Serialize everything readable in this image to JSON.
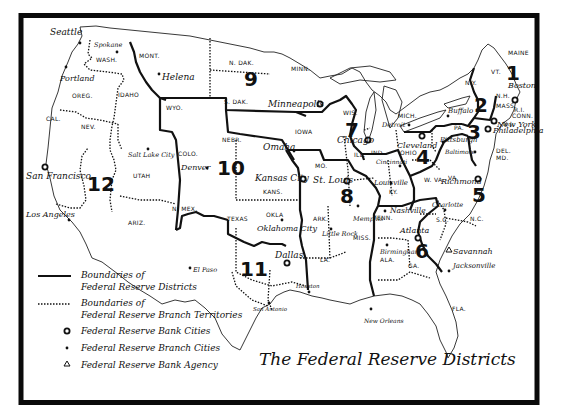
{
  "title": "The Federal Reserve Districts",
  "legend": [
    {
      "symbol": "solid-line",
      "label_line1": "Boundaries of",
      "label_line2": "Federal Reserve Districts"
    },
    {
      "symbol": "dotted-line",
      "label_line1": "Boundaries of",
      "label_line2": "Federal Reserve Branch Territories"
    },
    {
      "symbol": "open-circle",
      "label_line1": "Federal Reserve Bank Cities"
    },
    {
      "symbol": "dot",
      "label_line1": "Federal Reserve Branch Cities"
    },
    {
      "symbol": "triangle",
      "label_line1": "Federal Reserve Bank Agency"
    }
  ],
  "districts": [
    "1",
    "2",
    "3",
    "4",
    "5",
    "6",
    "7",
    "8",
    "9",
    "10",
    "11",
    "12"
  ],
  "states": [
    "WASH.",
    "OREG.",
    "CAL.",
    "NEV.",
    "IDAHO",
    "MONT.",
    "WYO.",
    "UTAH",
    "ARIZ.",
    "COLO.",
    "N. MEX.",
    "N. DAK.",
    "S. DAK.",
    "NEBR.",
    "KANS.",
    "OKLA",
    "TEXAS",
    "MINN.",
    "IOWA",
    "MO.",
    "ARK.",
    "LA.",
    "WIS.",
    "ILL.",
    "MISS.",
    "IND.",
    "OHIO",
    "KY.",
    "TENN.",
    "ALA.",
    "MICH.",
    "GA.",
    "FLA.",
    "S.C.",
    "N.C.",
    "VA.",
    "W. VA.",
    "PA.",
    "N.Y.",
    "VT.",
    "N.H.",
    "MAINE",
    "MASS.",
    "R.I.",
    "CONN.",
    "N.J.",
    "DEL.",
    "MD."
  ],
  "bank_cities": [
    "Boston",
    "New York",
    "Philadelphia",
    "Cleveland",
    "Richmond",
    "Atlanta",
    "Chicago",
    "St. Louis",
    "Minneapolis",
    "Kansas City",
    "Dallas",
    "San Francisco"
  ],
  "branch_cities": [
    "Seattle",
    "Spokane",
    "Portland",
    "Helena",
    "Salt Lake City",
    "Los Angeles",
    "Denver",
    "Omaha",
    "Oklahoma City",
    "El Paso",
    "Houston",
    "San Antonio",
    "Little Rock",
    "Memphis",
    "Louisville",
    "Nashville",
    "Birmingham",
    "Jacksonville",
    "New Orleans",
    "Detroit",
    "Buffalo",
    "Pittsburgh",
    "Cincinnati",
    "Baltimore",
    "Charlotte"
  ],
  "agencies": [
    "Savannah"
  ]
}
